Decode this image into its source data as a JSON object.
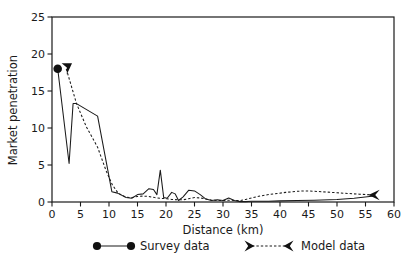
{
  "chart_data": {
    "type": "line",
    "title": "",
    "xlabel": "Distance (km)",
    "ylabel": "Market penetration",
    "xlim": [
      0,
      60
    ],
    "ylim": [
      0,
      25
    ],
    "xticks": [
      0,
      5,
      10,
      15,
      20,
      25,
      30,
      35,
      40,
      45,
      50,
      55,
      60
    ],
    "yticks": [
      0,
      5,
      10,
      15,
      20,
      25
    ],
    "xtick_labels": [
      "0",
      "5",
      "10",
      "15",
      "20",
      "25",
      "30",
      "35",
      "40",
      "45",
      "50",
      "55",
      "60"
    ],
    "ytick_labels": [
      "0",
      "5",
      "10",
      "15",
      "20",
      "25"
    ],
    "grid": false,
    "legend_position": "below",
    "series": [
      {
        "name": "Survey data",
        "style": "solid",
        "marker": "filled-circle",
        "x": [
          1.0,
          3.0,
          3.7,
          4.3,
          8.0,
          10.5,
          11.5,
          13.0,
          14.0,
          15.0,
          16.0,
          17.0,
          17.8,
          18.4,
          19.0,
          19.6,
          20.2,
          21.0,
          21.6,
          22.2,
          23.0,
          24.0,
          25.0,
          26.0,
          27.0,
          28.0,
          29.0,
          30.0,
          31.0,
          32.0,
          33.0,
          34.0,
          35.0,
          36.0,
          38.0,
          40.0,
          43.0,
          46.0,
          50.0,
          53.0,
          56.5
        ],
        "y": [
          18.0,
          5.2,
          13.3,
          13.3,
          11.6,
          1.4,
          1.2,
          0.6,
          0.5,
          1.0,
          1.1,
          1.8,
          1.7,
          1.0,
          4.3,
          0.6,
          0.5,
          1.3,
          1.1,
          0.2,
          0.7,
          1.6,
          1.5,
          1.0,
          0.4,
          0.2,
          0.3,
          0.2,
          0.55,
          0.2,
          0.05,
          0.05,
          0.1,
          0.1,
          0.1,
          0.15,
          0.2,
          0.25,
          0.35,
          0.5,
          0.8
        ]
      },
      {
        "name": "Model data",
        "style": "dashed",
        "marker": "arrow",
        "x": [
          2.5,
          4.3,
          6.0,
          8.0,
          9.5,
          10.6,
          11.6,
          13.0,
          14.0,
          15.0,
          16.0,
          17.0,
          18.0,
          19.0,
          20.0,
          21.0,
          22.0,
          23.0,
          24.0,
          25.0,
          26.0,
          27.0,
          28.0,
          29.0,
          30.0,
          31.0,
          32.0,
          33.0,
          34.0,
          35.0,
          36.5,
          38.0,
          39.5,
          41.0,
          43.0,
          44.5,
          46.0,
          48.0,
          50.0,
          52.0,
          54.0,
          56.5
        ],
        "y": [
          18.0,
          13.3,
          10.2,
          7.4,
          4.2,
          2.3,
          1.2,
          0.65,
          0.6,
          0.75,
          0.8,
          0.75,
          0.6,
          0.5,
          0.45,
          0.35,
          0.3,
          0.3,
          0.45,
          0.6,
          0.55,
          0.4,
          0.25,
          0.2,
          0.2,
          0.25,
          0.2,
          0.2,
          0.35,
          0.55,
          0.8,
          1.0,
          1.15,
          1.3,
          1.45,
          1.5,
          1.45,
          1.35,
          1.25,
          1.15,
          1.05,
          0.95
        ]
      }
    ],
    "markers": [
      {
        "series": "Survey data",
        "x": 1.0,
        "y": 18.0,
        "shape": "filled-circle"
      },
      {
        "series": "Model data",
        "x": 2.6,
        "y": 18.0,
        "shape": "arrow-down"
      },
      {
        "series": "Model data",
        "x": 56.5,
        "y": 0.95,
        "shape": "arrow-left"
      }
    ]
  },
  "legend": {
    "items": [
      {
        "label": "Survey data",
        "style": "solid",
        "marker": "filled-circle"
      },
      {
        "label": "Model data",
        "style": "dashed",
        "marker": "arrow"
      }
    ]
  }
}
